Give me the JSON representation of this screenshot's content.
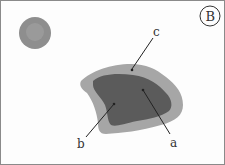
{
  "panel": {
    "letter": "B"
  },
  "labels": {
    "a": "a",
    "b": "b",
    "c": "c"
  },
  "colors": {
    "outer": "#a6a6a6",
    "inner": "#5b5b5b",
    "spot_outer": "#8e8e8e",
    "spot_inner": "#a3a3a3",
    "border": "#8a8a8a"
  }
}
